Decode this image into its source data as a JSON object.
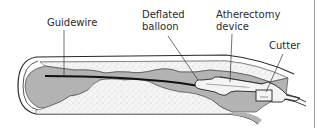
{
  "figure": {
    "colors": {
      "lumen": "#b3b3b3",
      "plaque": "#f2f2f2",
      "wall": "#ffffff",
      "outline": "#2a2a2a",
      "text": "#2b2b2b"
    },
    "labels": {
      "guidewire": "Guidewire",
      "deflated_balloon_line1": "Deflated",
      "deflated_balloon_line2": "balloon",
      "atherectomy_line1": "Atherectomy",
      "atherectomy_line2": "device",
      "cutter": "Cutter"
    }
  }
}
